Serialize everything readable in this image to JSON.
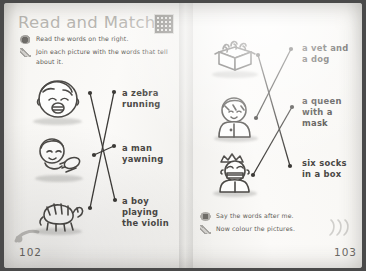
{
  "worksheet": {
    "title": "Read and Match",
    "qr_icon": "qr-code",
    "instructions": [
      {
        "icon": "ear-listen-icon",
        "text": "Read the words on the right."
      },
      {
        "icon": "pencil-icon",
        "text": "Join each picture with the words that tell about it."
      }
    ],
    "bottom_instructions": [
      {
        "icon": "mouth-speak-icon",
        "text": "Say the words after me."
      },
      {
        "icon": "crayon-icon",
        "text": "Now colour the pictures."
      }
    ],
    "page_numbers": {
      "left": "102",
      "right": "103"
    },
    "colors": {
      "page": "#fbfaf8",
      "ink": "#4c4a47",
      "label_text": "#4a4845",
      "instruction_text": "#5d5b57",
      "title_text": "#b9b7b2",
      "line": "#3c3a37"
    }
  },
  "left_page": {
    "pictures": [
      {
        "name": "yawning-boy-picture",
        "alt": "a boy yawning"
      },
      {
        "name": "violin-boy-picture",
        "alt": "a boy playing the violin"
      },
      {
        "name": "zebra-picture",
        "alt": "a zebra running"
      }
    ],
    "labels": [
      {
        "name": "label-zebra-running",
        "lines": [
          "a zebra",
          "running"
        ]
      },
      {
        "name": "label-man-yawning",
        "lines": [
          "a man",
          "yawning"
        ]
      },
      {
        "name": "label-boy-violin",
        "lines": [
          "a boy",
          "playing",
          "the violin"
        ]
      }
    ]
  },
  "right_page": {
    "pictures": [
      {
        "name": "box-of-socks-picture",
        "alt": "six socks in a box"
      },
      {
        "name": "vet-picture",
        "alt": "a vet and a dog"
      },
      {
        "name": "queen-picture",
        "alt": "a queen with a mask"
      }
    ],
    "labels": [
      {
        "name": "label-vet-dog",
        "lines": [
          "a vet and",
          "a dog"
        ]
      },
      {
        "name": "label-queen-mask",
        "lines": [
          "a queen",
          "with a",
          "mask"
        ]
      },
      {
        "name": "label-six-socks",
        "lines": [
          "six socks",
          "in a box"
        ]
      }
    ]
  }
}
